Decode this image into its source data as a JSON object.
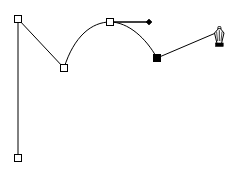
{
  "document": {
    "title": "Pen tool path construction",
    "canvas": {
      "width": 237,
      "height": 171,
      "background": "#ffffff"
    }
  },
  "style": {
    "stroke_color": "#000000",
    "anchor_fill_unselected": "#ffffff",
    "anchor_fill_selected": "#000000",
    "anchor_stroke": "#000000",
    "handle_color": "#000000",
    "cursor_color": "#000000",
    "path_stroke_width": 1,
    "anchor_size": 7
  },
  "path": {
    "name": "open-bezier-path",
    "segments": [
      {
        "id": "seg-vertical",
        "type": "line",
        "from": "anchor-bottom-left",
        "to": "anchor-top-left"
      },
      {
        "id": "seg-diagonal",
        "type": "line",
        "from": "anchor-top-left",
        "to": "anchor-valley"
      },
      {
        "id": "seg-arc-left",
        "type": "curve",
        "from": "anchor-valley",
        "to": "anchor-apex"
      },
      {
        "id": "seg-arc-right",
        "type": "curve",
        "from": "anchor-apex",
        "to": "anchor-selected"
      },
      {
        "id": "seg-rubber-band",
        "type": "line",
        "from": "anchor-selected",
        "to": "pen-cursor"
      }
    ],
    "d": "M 18 158 L 18 19 L 64 68 C 74 36 92 22 110 22 C 128 22 146 38 157 58 L 218 32"
  },
  "anchors": [
    {
      "id": "anchor-top-left",
      "label": "Anchor point 1",
      "x": 18,
      "y": 19,
      "state": "unselected",
      "shape": "square-hollow"
    },
    {
      "id": "anchor-bottom-left",
      "label": "Anchor point 2",
      "x": 18,
      "y": 158,
      "state": "unselected",
      "shape": "square-hollow"
    },
    {
      "id": "anchor-valley",
      "label": "Anchor point 3",
      "x": 64,
      "y": 68,
      "state": "unselected",
      "shape": "square-hollow"
    },
    {
      "id": "anchor-apex",
      "label": "Anchor point 4",
      "x": 110,
      "y": 22,
      "state": "unselected",
      "shape": "square-hollow"
    },
    {
      "id": "anchor-selected",
      "label": "Anchor point 5",
      "x": 157,
      "y": 58,
      "state": "selected",
      "shape": "square-filled"
    }
  ],
  "direction_handles": [
    {
      "id": "handle-apex-out",
      "label": "Direction handle",
      "anchor": "anchor-apex",
      "from_x": 110,
      "from_y": 22,
      "to_x": 149,
      "to_y": 22,
      "endpoint_shape": "diamond-filled"
    }
  ],
  "cursor": {
    "id": "pen-cursor",
    "icon": "pen-nib-icon",
    "label": "Pen tool",
    "x": 218,
    "y": 32
  }
}
